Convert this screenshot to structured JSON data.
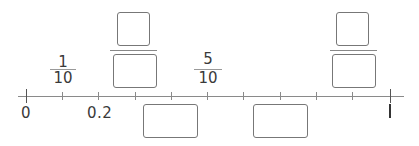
{
  "number_line": {
    "start_label": "0",
    "end_label": "1",
    "tick_count": 11,
    "labeled_points": [
      {
        "position": 0,
        "label": "0"
      },
      {
        "position": 0.2,
        "label": "0.2"
      },
      {
        "position": 1,
        "label": "1"
      }
    ]
  },
  "fractions_above": [
    {
      "position": 0.1,
      "numerator": "1",
      "denominator": "10"
    },
    {
      "position": 0.5,
      "numerator": "5",
      "denominator": "10"
    }
  ],
  "answer_boxes": [
    {
      "id": "fraction-box-left",
      "type": "fraction",
      "position": 0.3,
      "numerator": "",
      "denominator": ""
    },
    {
      "id": "decimal-box-left",
      "type": "decimal",
      "position": 0.4,
      "value": ""
    },
    {
      "id": "decimal-box-right",
      "type": "decimal",
      "position": 0.7,
      "value": ""
    },
    {
      "id": "fraction-box-right",
      "type": "fraction",
      "position": 0.9,
      "numerator": "",
      "denominator": ""
    }
  ]
}
